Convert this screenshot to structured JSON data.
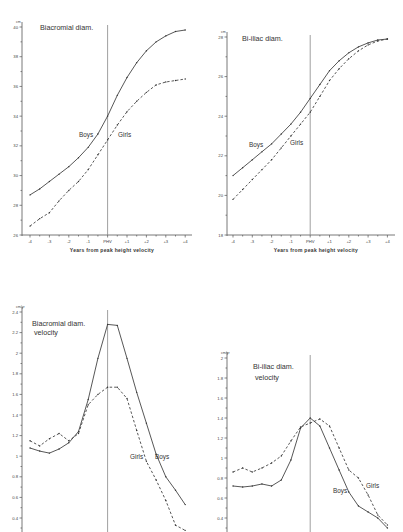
{
  "chart_data": [
    {
      "id": "biacromial",
      "type": "line",
      "title": "Biacromial diam.",
      "unit": "cm",
      "xlabel": "Years from peak height velocity",
      "ylabel": "",
      "x_ticks": [
        "-4",
        "-3",
        "-2",
        "-1",
        "PHV",
        "+1",
        "+2",
        "+3",
        "+4"
      ],
      "y_ticks": [
        26,
        28,
        30,
        32,
        34,
        36,
        38,
        40
      ],
      "ylim": [
        26,
        40
      ],
      "x": [
        -4,
        -3.5,
        -3,
        -2.5,
        -2,
        -1.5,
        -1,
        -0.5,
        0,
        0.5,
        1,
        1.5,
        2,
        2.5,
        3,
        3.5,
        4
      ],
      "series": [
        {
          "name": "Boys",
          "style": "solid",
          "values": [
            28.7,
            29.1,
            29.6,
            30.1,
            30.6,
            31.2,
            31.9,
            32.8,
            34.0,
            35.4,
            36.6,
            37.6,
            38.4,
            39.0,
            39.4,
            39.7,
            39.8
          ]
        },
        {
          "name": "Girls",
          "style": "dashed",
          "values": [
            26.6,
            27.1,
            27.5,
            28.3,
            29.0,
            29.6,
            30.4,
            31.4,
            32.4,
            33.4,
            34.3,
            35.0,
            35.6,
            36.1,
            36.3,
            36.4,
            36.5
          ]
        }
      ],
      "labels": {
        "boys": "Boys",
        "girls": "Girls"
      },
      "grid": false,
      "legend": "inline labels"
    },
    {
      "id": "biiliac",
      "type": "line",
      "title": "Bi-iliac diam.",
      "unit": "cm",
      "xlabel": "Years from peak height velocity",
      "ylabel": "",
      "x_ticks": [
        "-4",
        "-3",
        "-2",
        "-1",
        "PHV",
        "+1",
        "+2",
        "+3",
        "+4"
      ],
      "y_ticks": [
        18,
        20,
        22,
        24,
        26,
        28
      ],
      "ylim": [
        18,
        28
      ],
      "x": [
        -4,
        -3.5,
        -3,
        -2.5,
        -2,
        -1.5,
        -1,
        -0.5,
        0,
        0.5,
        1,
        1.5,
        2,
        2.5,
        3,
        3.5,
        4
      ],
      "series": [
        {
          "name": "Boys",
          "style": "solid",
          "values": [
            21.0,
            21.4,
            21.8,
            22.2,
            22.6,
            23.1,
            23.6,
            24.2,
            24.9,
            25.6,
            26.3,
            26.8,
            27.2,
            27.5,
            27.7,
            27.85,
            27.9
          ]
        },
        {
          "name": "Girls",
          "style": "dashed",
          "values": [
            19.8,
            20.3,
            20.8,
            21.3,
            21.8,
            22.4,
            23.0,
            23.6,
            24.2,
            25.0,
            25.8,
            26.4,
            26.9,
            27.3,
            27.6,
            27.8,
            27.9
          ]
        }
      ],
      "labels": {
        "boys": "Boys",
        "girls": "Girls"
      },
      "grid": false,
      "legend": "inline labels"
    },
    {
      "id": "biacromial-velocity",
      "type": "line",
      "title": "Biacromial diam.",
      "title2": "velocity",
      "unit": "cm/yr",
      "xlabel": "",
      "ylabel": "",
      "y_ticks": [
        0.4,
        0.6,
        0.8,
        1.0,
        1.2,
        1.4,
        1.6,
        1.8,
        2.0,
        2.2,
        2.4
      ],
      "ylim": [
        0.3,
        2.4
      ],
      "x": [
        -4,
        -3.5,
        -3,
        -2.5,
        -2,
        -1.5,
        -1,
        -0.5,
        0,
        0.5,
        1,
        1.5,
        2,
        2.5,
        3,
        3.5,
        4
      ],
      "series": [
        {
          "name": "Boys",
          "style": "solid",
          "values": [
            1.08,
            1.05,
            1.03,
            1.07,
            1.13,
            1.24,
            1.55,
            1.95,
            2.28,
            2.27,
            1.95,
            1.62,
            1.32,
            1.02,
            0.8,
            0.67,
            0.53
          ]
        },
        {
          "name": "Girls",
          "style": "dashed",
          "values": [
            1.15,
            1.1,
            1.17,
            1.22,
            1.15,
            1.22,
            1.5,
            1.6,
            1.67,
            1.67,
            1.56,
            1.25,
            0.95,
            0.77,
            0.57,
            0.33,
            0.28
          ]
        }
      ],
      "labels": {
        "boys": "Boys",
        "girls": "Girls"
      },
      "grid": false,
      "legend": "inline labels"
    },
    {
      "id": "biiliac-velocity",
      "type": "line",
      "title": "Bi-iliac diam.",
      "title2": "velocity",
      "unit": "cm/yr",
      "xlabel": "",
      "ylabel": "",
      "y_ticks": [
        0.4,
        0.6,
        0.8,
        1.0,
        1.2,
        1.4,
        1.6,
        1.8,
        2.0
      ],
      "ylim": [
        0.3,
        2.0
      ],
      "x": [
        -4,
        -3.5,
        -3,
        -2.5,
        -2,
        -1.5,
        -1,
        -0.5,
        0,
        0.5,
        1,
        1.5,
        2,
        2.5,
        3,
        3.5,
        4
      ],
      "series": [
        {
          "name": "Boys",
          "style": "solid",
          "values": [
            0.72,
            0.71,
            0.72,
            0.74,
            0.72,
            0.78,
            0.98,
            1.3,
            1.4,
            1.32,
            1.1,
            0.88,
            0.66,
            0.52,
            0.46,
            0.4,
            0.3
          ]
        },
        {
          "name": "Girls",
          "style": "dashed",
          "values": [
            0.86,
            0.9,
            0.86,
            0.9,
            0.95,
            1.02,
            1.17,
            1.31,
            1.35,
            1.39,
            1.32,
            1.1,
            0.88,
            0.8,
            0.63,
            0.43,
            0.33
          ]
        }
      ],
      "labels": {
        "boys": "Boys",
        "girls": "Girls"
      },
      "grid": false,
      "legend": "inline labels"
    }
  ],
  "layout": [
    {
      "x0": 22,
      "ytop": 27,
      "ybot": 235,
      "xleft": 30,
      "xstep": 19.4,
      "xend": 192,
      "axis_top": 22,
      "axis_bot": 236,
      "tick_y": 241,
      "xlabel_y": 252,
      "title_x": 40,
      "title_y": 30,
      "boys_lbl": [
        79,
        137
      ],
      "girls_lbl": [
        118,
        137
      ]
    },
    {
      "x0": 227,
      "ytop": 37,
      "ybot": 235,
      "xleft": 233,
      "xstep": 19.3,
      "xend": 395,
      "axis_top": 32,
      "axis_bot": 236,
      "tick_y": 241,
      "xlabel_y": 252,
      "title_x": 242,
      "title_y": 41,
      "boys_lbl": [
        249,
        147
      ],
      "girls_lbl": [
        290,
        145
      ]
    },
    {
      "x0": 22,
      "ytop": 312,
      "ybot": 518,
      "xleft": 30,
      "xstep": 19.4,
      "xend": 192,
      "axis_top": 307,
      "axis_bot": 532,
      "title_x": 32,
      "title_y": 326,
      "title2_y": 335,
      "boys_lbl": [
        155,
        459
      ],
      "girls_lbl": [
        130,
        459
      ]
    },
    {
      "x0": 227,
      "ytop": 358,
      "ybot": 518,
      "xleft": 233,
      "xstep": 19.3,
      "xend": 395,
      "axis_top": 352,
      "axis_bot": 532,
      "title_x": 253,
      "title_y": 369,
      "title2_y": 380,
      "boys_lbl": [
        333,
        493
      ],
      "girls_lbl": [
        366,
        488
      ]
    }
  ]
}
